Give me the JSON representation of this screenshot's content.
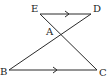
{
  "diagram": {
    "type": "geometry",
    "colors": {
      "stroke": "#2a2a2a",
      "label": "#222222"
    },
    "points": {
      "E": {
        "label": "E",
        "x": 40,
        "y": 14
      },
      "D": {
        "label": "D",
        "x": 91,
        "y": 14
      },
      "A": {
        "label": "A",
        "x": 60,
        "y": 34
      },
      "B": {
        "label": "B",
        "x": 9,
        "y": 70
      },
      "C": {
        "label": "C",
        "x": 97,
        "y": 70
      }
    },
    "segments": [
      {
        "from": "E",
        "to": "D",
        "parallel_mark": true
      },
      {
        "from": "B",
        "to": "C",
        "parallel_mark": true
      },
      {
        "from": "E",
        "to": "C",
        "parallel_mark": false
      },
      {
        "from": "D",
        "to": "B",
        "parallel_mark": false
      }
    ]
  }
}
